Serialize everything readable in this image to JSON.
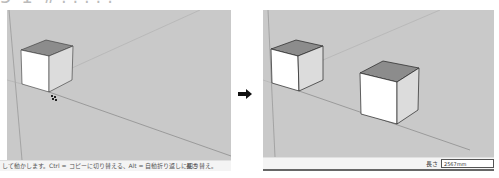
{
  "header": {
    "title_partial": "5 1 #?????"
  },
  "before_panel": {
    "status_text": "して動かします。Ctrl = コピーに切り替える、Alt = 自動折り返しに切り替え。",
    "length_label": "長さ"
  },
  "after_panel": {
    "length_label": "長さ",
    "length_value": "2567mm"
  },
  "arrow": {
    "icon": "arrow-right-icon",
    "glyph": "➡"
  },
  "colors": {
    "canvas": "#c9c9c9",
    "cube_top": "#8c8c8c",
    "cube_left": "#ffffff",
    "cube_right": "#dcdcdc",
    "edge": "#333333",
    "status_bg": "#f4f4f4"
  }
}
